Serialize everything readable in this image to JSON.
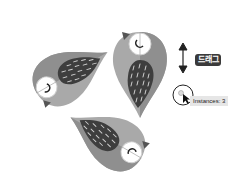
{
  "canvas": {
    "description": "Radial repeat of bird illustration",
    "instance_count": 3
  },
  "hint": {
    "drag_label": "드래그",
    "tooltip_text": "Instances: 3"
  },
  "colors": {
    "body_light": "#b4b4b4",
    "body_dark": "#8e8e8e",
    "wing": "#3f3f3f",
    "wing_marks": "#d0d0d0",
    "eye_ring": "#ffffff",
    "beak": "#555555"
  },
  "icons": [
    "up-down-arrow-icon",
    "radial-handle-icon",
    "cursor-arrow-icon"
  ]
}
